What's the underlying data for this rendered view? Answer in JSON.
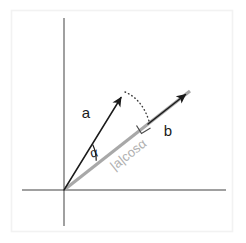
{
  "figure": {
    "background_color": "#ffffff",
    "frame_color": "#f2f2f2",
    "labels": {
      "vector_a": "a",
      "vector_b": "b",
      "angle": "α",
      "projection": "|a|cosα"
    },
    "colors": {
      "axis": "#808080",
      "vector": "#1b1b1b",
      "projection": "#a8a8a8",
      "dotted": "#3a3a3a",
      "projection_label": "#b0b0b0"
    },
    "geometry": {
      "origin": {
        "x": 64,
        "y": 190
      },
      "x_axis": {
        "x1": 22,
        "y1": 190,
        "x2": 226,
        "y2": 190
      },
      "y_axis": {
        "x1": 64,
        "y1": 18,
        "x2": 64,
        "y2": 226
      },
      "vector_a": {
        "x1": 64,
        "y1": 190,
        "x2": 124,
        "y2": 93,
        "angle_deg": 58.3
      },
      "vector_b": {
        "x1": 64,
        "y1": 190,
        "x2": 190,
        "y2": 91,
        "angle_deg": 38.2
      },
      "projection_segment": {
        "x1": 64,
        "y1": 190,
        "x2": 148,
        "y2": 124
      },
      "dotted_segment": {
        "x1": 124,
        "y1": 93,
        "x2": 148,
        "y2": 124
      },
      "angle_arc_radius": 38,
      "right_angle_marker": true
    }
  }
}
